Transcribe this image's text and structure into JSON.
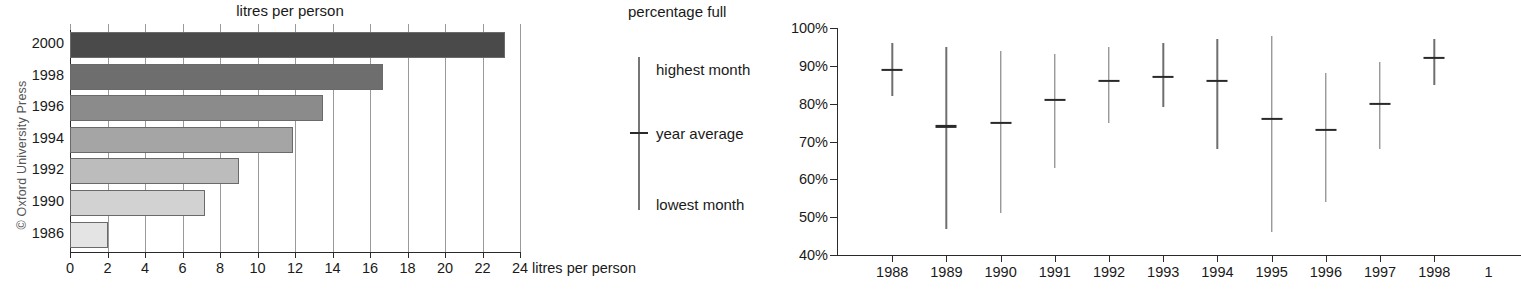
{
  "copyright": "© Oxford University Press",
  "bar_chart": {
    "title": "litres per person",
    "x_axis_title": "litres per person",
    "ticks": [
      "0",
      "2",
      "4",
      "6",
      "8",
      "10",
      "12",
      "14",
      "16",
      "18",
      "20",
      "22",
      "24"
    ],
    "categories": [
      "2000",
      "1998",
      "1996",
      "1994",
      "1992",
      "1990",
      "1986"
    ]
  },
  "legend": {
    "title": "percentage full",
    "highest": "highest month",
    "average": "year average",
    "lowest": "lowest month"
  },
  "range_chart": {
    "y_ticks": [
      "100%",
      "90%",
      "80%",
      "70%",
      "60%",
      "50%",
      "40%"
    ],
    "x_ticks": [
      "1988",
      "1989",
      "1990",
      "1991",
      "1992",
      "1993",
      "1994",
      "1995",
      "1996",
      "1997",
      "1998",
      "1"
    ]
  },
  "chart_data": [
    {
      "type": "bar",
      "orientation": "horizontal",
      "title": "litres per person",
      "xlabel": "litres per person",
      "ylabel": "",
      "xlim": [
        0,
        24
      ],
      "xticks": [
        0,
        2,
        4,
        6,
        8,
        10,
        12,
        14,
        16,
        18,
        20,
        22,
        24
      ],
      "grid": "vertical",
      "categories": [
        "2000",
        "1998",
        "1996",
        "1994",
        "1992",
        "1990",
        "1986"
      ],
      "values": [
        23.2,
        16.7,
        13.5,
        11.9,
        9.0,
        7.2,
        2.0
      ],
      "bar_colors": [
        "#4a4a4a",
        "#6e6e6e",
        "#8b8b8b",
        "#a5a5a5",
        "#bcbcbc",
        "#d2d2d2",
        "#e4e4e4"
      ]
    },
    {
      "type": "range",
      "title": "percentage full",
      "xlabel": "",
      "ylabel": "percentage full",
      "ylim": [
        40,
        100
      ],
      "yticks": [
        40,
        50,
        60,
        70,
        80,
        90,
        100
      ],
      "grid": "none",
      "x": [
        "1988",
        "1989",
        "1990",
        "1991",
        "1992",
        "1993",
        "1994",
        "1995",
        "1996",
        "1997",
        "1998"
      ],
      "series": [
        {
          "name": "highest month",
          "values": [
            96,
            95,
            94,
            93,
            95,
            96,
            97,
            98,
            88,
            91,
            97
          ]
        },
        {
          "name": "year average",
          "values": [
            89,
            74,
            75,
            81,
            86,
            87,
            86,
            76,
            73,
            80,
            92
          ]
        },
        {
          "name": "lowest month",
          "values": [
            82,
            47,
            51,
            63,
            75,
            79,
            68,
            46,
            54,
            68,
            85
          ]
        }
      ]
    }
  ]
}
